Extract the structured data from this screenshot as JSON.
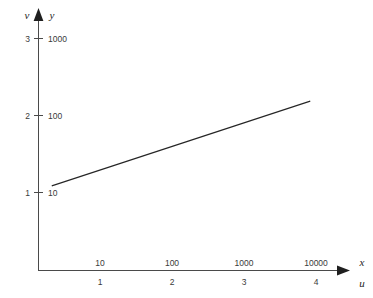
{
  "figure": {
    "background_color": "#ffffff",
    "axis_color": "#4a4a4a",
    "line_color": "#262626",
    "width": 373,
    "height": 298
  },
  "axes": {
    "vertical": {
      "outer_symbol": "v",
      "inner_symbol": "y",
      "outer_ticks": [
        "1",
        "2",
        "3"
      ],
      "inner_ticks": [
        "10",
        "100",
        "1000"
      ]
    },
    "horizontal": {
      "upper_symbol": "x",
      "lower_symbol": "u",
      "upper_ticks": [
        "10",
        "100",
        "1000",
        "10000"
      ],
      "lower_ticks": [
        "1",
        "2",
        "3",
        "4"
      ]
    }
  },
  "chart_data": {
    "type": "line",
    "title": "",
    "subtitle": "",
    "xlabel": "x",
    "ylabel": "y",
    "xlabel_secondary": "u",
    "ylabel_secondary": "v",
    "scale": "log-log",
    "grid": false,
    "legend": false,
    "legend_position": "none",
    "x_tick_labels": [
      "10",
      "100",
      "1000",
      "10000"
    ],
    "x_tick_values": [
      10,
      100,
      1000,
      10000
    ],
    "x_tick_labels_secondary": [
      "1",
      "2",
      "3",
      "4"
    ],
    "x_tick_values_secondary": [
      1,
      2,
      3,
      4
    ],
    "y_tick_labels": [
      "10",
      "100",
      "1000"
    ],
    "y_tick_values": [
      10,
      100,
      1000
    ],
    "y_tick_labels_secondary": [
      "1",
      "2",
      "3"
    ],
    "y_tick_values_secondary": [
      1,
      2,
      3
    ],
    "xlim_log": [
      0.33,
      3.92
    ],
    "ylim_log": [
      1.08,
      2.18
    ],
    "series": [
      {
        "name": "log-log straight line",
        "u": [
          0.33,
          3.92
        ],
        "v": [
          1.08,
          2.18
        ],
        "x": [
          2.14,
          8318
        ],
        "y": [
          12.0,
          151.4
        ],
        "slope": 0.31,
        "intercept": 0.98
      }
    ],
    "annotations": []
  }
}
